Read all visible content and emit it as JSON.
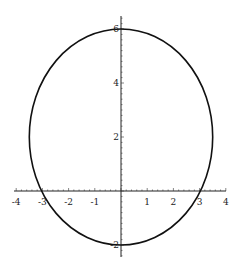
{
  "chart_data": {
    "type": "line",
    "title": "",
    "xlabel": "",
    "ylabel": "",
    "curve": {
      "shape": "ellipse",
      "center": [
        0,
        2
      ],
      "rx": 3.5,
      "ry": 4
    },
    "points": [
      {
        "x": 0,
        "y": 6
      },
      {
        "x": 3.5,
        "y": 2
      },
      {
        "x": 0,
        "y": -2
      },
      {
        "x": -3.5,
        "y": 2
      },
      {
        "x": 3.03,
        "y": 0
      },
      {
        "x": -3.03,
        "y": 0
      }
    ],
    "xlim": [
      -4,
      4
    ],
    "ylim": [
      -2.5,
      6.5
    ],
    "xticks": [
      -4,
      -3,
      -2,
      -1,
      1,
      2,
      3,
      4
    ],
    "yticks": [
      -2,
      2,
      4,
      6
    ],
    "grid": false,
    "legend": null,
    "colors": {
      "curve": "#111111",
      "axes": "#222222"
    }
  },
  "axes": {
    "x_tick_labels": [
      "-4",
      "-3",
      "-2",
      "-1",
      "1",
      "2",
      "3",
      "4"
    ],
    "y_tick_labels": [
      "6",
      "4",
      "2",
      "-2"
    ]
  }
}
